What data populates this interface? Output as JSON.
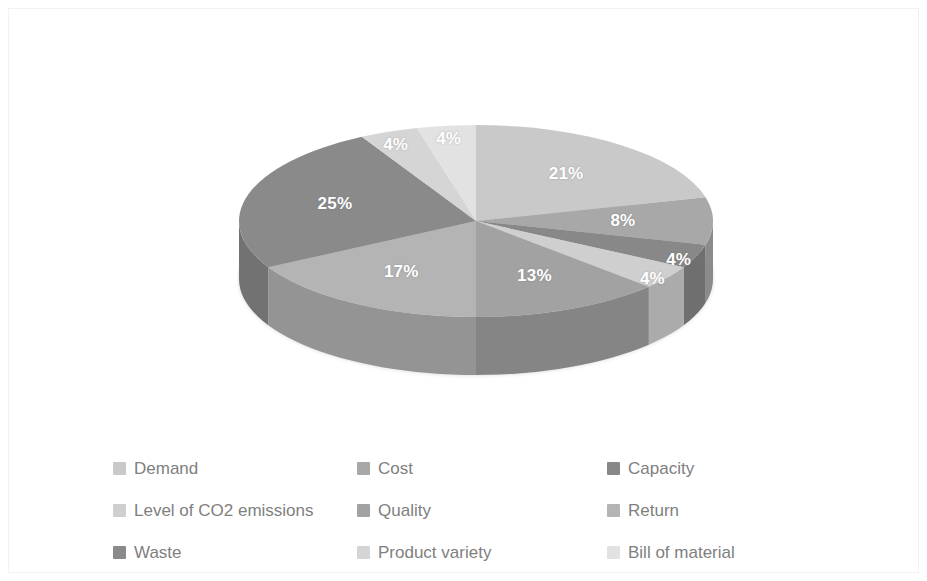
{
  "chart_data": {
    "type": "pie",
    "title": "",
    "subtitle": "",
    "xlabel": "",
    "ylabel": "",
    "grid": false,
    "three_d": true,
    "start_angle_deg": 0,
    "direction": "clockwise",
    "legend_position": "bottom",
    "legend_columns": 3,
    "value_unit": "%",
    "labels_shown_on_slices": true,
    "categories": [
      "Demand",
      "Cost",
      "Capacity",
      "Level of CO2 emissions",
      "Quality",
      "Return",
      "Waste",
      "Product variety",
      "Bill of material"
    ],
    "values": [
      21,
      8,
      4,
      4,
      13,
      17,
      25,
      4,
      4
    ],
    "data_labels": [
      "21%",
      "8%",
      "4%",
      "4%",
      "13%",
      "17%",
      "25%",
      "4%",
      "4%"
    ],
    "colors": [
      "#c9c9c9",
      "#a8a8a8",
      "#888888",
      "#cfcfcf",
      "#a2a2a2",
      "#b4b4b4",
      "#8a8a8a",
      "#d5d5d5",
      "#e2e2e2"
    ],
    "slices": [
      {
        "label": "Demand",
        "value": 21,
        "display": "21%",
        "color": "#c9c9c9",
        "side_color": "#a6a6a6"
      },
      {
        "label": "Cost",
        "value": 8,
        "display": "8%",
        "color": "#a8a8a8",
        "side_color": "#8b8b8b"
      },
      {
        "label": "Capacity",
        "value": 4,
        "display": "4%",
        "color": "#888888",
        "side_color": "#6f6f6f"
      },
      {
        "label": "Level of CO2 emissions",
        "value": 4,
        "display": "4%",
        "color": "#cfcfcf",
        "side_color": "#ababab"
      },
      {
        "label": "Quality",
        "value": 13,
        "display": "13%",
        "color": "#a2a2a2",
        "side_color": "#858585"
      },
      {
        "label": "Return",
        "value": 17,
        "display": "17%",
        "color": "#b4b4b4",
        "side_color": "#949494"
      },
      {
        "label": "Waste",
        "value": 25,
        "display": "25%",
        "color": "#8a8a8a",
        "side_color": "#727272"
      },
      {
        "label": "Product variety",
        "value": 4,
        "display": "4%",
        "color": "#d5d5d5",
        "side_color": "#b0b0b0"
      },
      {
        "label": "Bill of material",
        "value": 4,
        "display": "4%",
        "color": "#e2e2e2",
        "side_color": "#bdbdbd"
      }
    ]
  },
  "legend": {
    "items": [
      {
        "label": "Demand",
        "color": "#c9c9c9"
      },
      {
        "label": "Cost",
        "color": "#a8a8a8"
      },
      {
        "label": "Capacity",
        "color": "#888888"
      },
      {
        "label": "Level of CO2 emissions",
        "color": "#cfcfcf"
      },
      {
        "label": "Quality",
        "color": "#a2a2a2"
      },
      {
        "label": "Return",
        "color": "#b4b4b4"
      },
      {
        "label": "Waste",
        "color": "#8a8a8a"
      },
      {
        "label": "Product variety",
        "color": "#d5d5d5"
      },
      {
        "label": "Bill of material",
        "color": "#e2e2e2"
      }
    ]
  },
  "style": {
    "background": "#ffffff",
    "border_color": "#f2f2f2",
    "label_text_color": "#ffffff",
    "legend_text_color": "#808080"
  }
}
